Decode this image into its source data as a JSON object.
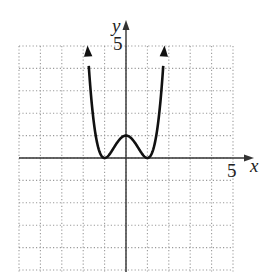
{
  "chart_data": {
    "type": "line",
    "title": "",
    "xlabel": "x",
    "ylabel": "y",
    "xlim": [
      -5,
      5
    ],
    "ylim": [
      -5,
      5
    ],
    "grid": true,
    "grid_style": "dotted",
    "grid_step": 1,
    "tick_labels": {
      "x": [
        "5"
      ],
      "y": [
        "5"
      ]
    },
    "series": [
      {
        "name": "curve",
        "equation": "y = (x^2 - 1)^2",
        "x": [
          -1.8,
          -1.6,
          -1.4,
          -1.2,
          -1.0,
          -0.8,
          -0.6,
          -0.4,
          -0.2,
          0.0,
          0.2,
          0.4,
          0.6,
          0.8,
          1.0,
          1.2,
          1.4,
          1.6,
          1.8
        ],
        "y": [
          5.02,
          2.43,
          0.92,
          0.19,
          0.0,
          0.13,
          0.41,
          0.71,
          0.92,
          1.0,
          0.92,
          0.71,
          0.41,
          0.13,
          0.0,
          0.19,
          0.92,
          2.43,
          5.02
        ],
        "arrows_at_ends": true,
        "key_points": {
          "local_max": [
            0,
            1
          ],
          "minima": [
            [
              -1,
              0
            ],
            [
              1,
              0
            ]
          ]
        }
      }
    ]
  },
  "labels": {
    "x_axis": "x",
    "y_axis": "y",
    "x_tick": "5",
    "y_tick": "5"
  },
  "colors": {
    "curve": "#111111",
    "axes": "#333333",
    "grid": "#9a9a9a"
  }
}
